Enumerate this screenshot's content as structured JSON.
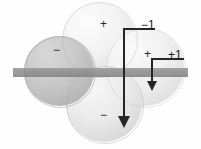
{
  "figure": {
    "background_color": "#fefefe",
    "width": 201,
    "height": 149
  },
  "axis_bar": {
    "name": "horizontal-plane-bar",
    "color": "#8a8a8a",
    "x": 13,
    "y": 68,
    "width": 175,
    "height": 9
  },
  "lobes": [
    {
      "id": "top",
      "sign": "+",
      "shade": "light",
      "cx": 99,
      "cy": 39,
      "r": 37,
      "color": "#f0f0f0"
    },
    {
      "id": "right",
      "sign": "+",
      "shade": "light",
      "cx": 145,
      "cy": 67,
      "r": 39,
      "color": "#ececec"
    },
    {
      "id": "bottom",
      "sign": "−",
      "shade": "medium",
      "cx": 104,
      "cy": 104,
      "r": 38,
      "color": "#e2e2e2"
    },
    {
      "id": "left",
      "sign": "−",
      "shade": "dark",
      "cx": 59,
      "cy": 71,
      "r": 35,
      "color": "#bdbdbd"
    }
  ],
  "signs": {
    "top": "+",
    "right": "+",
    "bottom": "−",
    "left": "−"
  },
  "arrows": [
    {
      "id": "minus-one",
      "label": "−1",
      "direction": "down",
      "length": 92,
      "line_color": "#262626",
      "x": 124,
      "y_start": 28,
      "y_end": 120
    },
    {
      "id": "plus-one",
      "label": "+1",
      "direction": "down",
      "length": 26,
      "line_color": "#262626",
      "x": 152,
      "y_start": 58,
      "y_end": 84
    }
  ],
  "labels": {
    "minus_one": "−1",
    "plus_one": "+1"
  }
}
